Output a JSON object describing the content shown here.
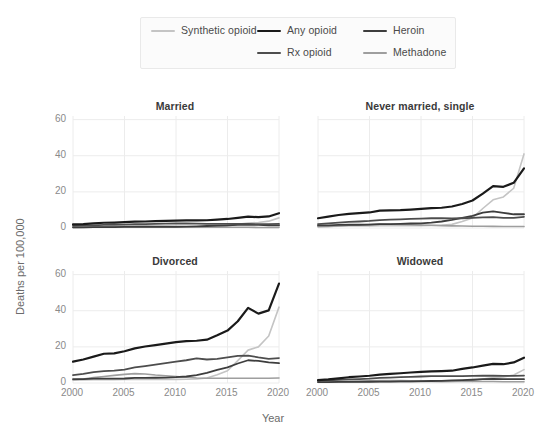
{
  "legend": {
    "items": [
      {
        "label": "Any opioid",
        "color": "#1a1a1a",
        "width": 2.2
      },
      {
        "label": "Rx opioid",
        "color": "#4d4d4d",
        "width": 1.8
      },
      {
        "label": "Heroin",
        "color": "#3d3d3d",
        "width": 1.8
      },
      {
        "label": "Methadone",
        "color": "#9e9e9e",
        "width": 1.6
      },
      {
        "label": "Synthetic opioid",
        "color": "#c4c4c4",
        "width": 1.6
      }
    ]
  },
  "axes": {
    "xlabel": "Year",
    "ylabel": "Deaths per 100,000",
    "yticks": [
      0,
      20,
      40,
      60
    ],
    "xticks": [
      2000,
      2005,
      2010,
      2015,
      2020
    ],
    "ylim": [
      0,
      62
    ],
    "xlim": [
      2000,
      2020
    ],
    "grid": true,
    "grid_color": "#ececec"
  },
  "chart_data": {
    "type": "line",
    "title": "",
    "xlabel": "Year",
    "ylabel": "Deaths per 100,000",
    "ylim": [
      0,
      62
    ],
    "xlim": [
      2000,
      2020
    ],
    "grid": true,
    "legend_position": "top-center",
    "x": [
      2000,
      2001,
      2002,
      2003,
      2004,
      2005,
      2006,
      2007,
      2008,
      2009,
      2010,
      2011,
      2012,
      2013,
      2014,
      2015,
      2016,
      2017,
      2018,
      2019,
      2020
    ],
    "panels": [
      {
        "title": "Married",
        "series": [
          {
            "name": "Any opioid",
            "color": "#1a1a1a",
            "values": [
              2.0,
              2.2,
              2.6,
              2.9,
              3.0,
              3.2,
              3.5,
              3.6,
              3.8,
              3.9,
              4.1,
              4.2,
              4.2,
              4.3,
              4.6,
              5.0,
              5.6,
              6.3,
              6.0,
              6.4,
              8.2
            ]
          },
          {
            "name": "Rx opioid",
            "color": "#4d4d4d",
            "values": [
              1.2,
              1.3,
              1.5,
              1.7,
              1.8,
              1.9,
              2.1,
              2.2,
              2.3,
              2.4,
              2.5,
              2.5,
              2.4,
              2.3,
              2.3,
              2.3,
              2.3,
              2.3,
              2.1,
              2.1,
              2.3
            ]
          },
          {
            "name": "Heroin",
            "color": "#3d3d3d",
            "values": [
              0.4,
              0.4,
              0.5,
              0.5,
              0.5,
              0.6,
              0.7,
              0.7,
              0.7,
              0.7,
              0.7,
              0.8,
              0.9,
              1.1,
              1.3,
              1.5,
              1.8,
              1.9,
              1.7,
              1.5,
              1.4
            ]
          },
          {
            "name": "Methadone",
            "color": "#9e9e9e",
            "values": [
              0.3,
              0.4,
              0.5,
              0.6,
              0.7,
              0.8,
              0.9,
              0.9,
              0.8,
              0.8,
              0.7,
              0.7,
              0.6,
              0.5,
              0.5,
              0.4,
              0.4,
              0.4,
              0.3,
              0.3,
              0.3
            ]
          },
          {
            "name": "Synthetic opioid",
            "color": "#c4c4c4",
            "values": [
              0.3,
              0.3,
              0.4,
              0.4,
              0.4,
              0.5,
              0.5,
              0.5,
              0.5,
              0.5,
              0.5,
              0.5,
              0.5,
              0.6,
              0.9,
              1.2,
              2.0,
              2.8,
              3.0,
              3.8,
              5.6
            ]
          }
        ]
      },
      {
        "title": "Never married, single",
        "series": [
          {
            "name": "Any opioid",
            "color": "#1a1a1a",
            "values": [
              5.4,
              6.3,
              7.2,
              7.8,
              8.2,
              8.6,
              9.6,
              9.8,
              9.9,
              10.2,
              10.6,
              11.0,
              11.2,
              11.9,
              13.3,
              15.2,
              19.0,
              23.2,
              22.8,
              25.0,
              33.0
            ]
          },
          {
            "name": "Rx opioid",
            "color": "#4d4d4d",
            "values": [
              2.2,
              2.6,
              3.0,
              3.4,
              3.6,
              3.9,
              4.4,
              4.6,
              4.8,
              5.0,
              5.2,
              5.4,
              5.4,
              5.3,
              5.4,
              5.6,
              5.9,
              6.0,
              5.6,
              5.6,
              6.2
            ]
          },
          {
            "name": "Heroin",
            "color": "#3d3d3d",
            "values": [
              1.4,
              1.5,
              1.7,
              1.8,
              1.8,
              1.9,
              2.2,
              2.2,
              2.3,
              2.5,
              2.6,
              3.0,
              3.6,
              4.5,
              5.6,
              6.7,
              8.5,
              9.2,
              8.4,
              7.6,
              7.6
            ]
          },
          {
            "name": "Methadone",
            "color": "#9e9e9e",
            "values": [
              0.7,
              0.9,
              1.2,
              1.5,
              1.7,
              1.9,
              2.2,
              2.1,
              1.9,
              1.8,
              1.6,
              1.5,
              1.3,
              1.2,
              1.1,
              1.0,
              1.0,
              0.9,
              0.8,
              0.8,
              0.8
            ]
          },
          {
            "name": "Synthetic opioid",
            "color": "#c4c4c4",
            "values": [
              0.8,
              0.9,
              1.0,
              1.1,
              1.1,
              1.2,
              1.3,
              1.3,
              1.3,
              1.3,
              1.3,
              1.4,
              1.5,
              2.0,
              3.6,
              5.6,
              10.8,
              15.6,
              17.2,
              22.0,
              41.0
            ]
          }
        ]
      },
      {
        "title": "Divorced",
        "series": [
          {
            "name": "Any opioid",
            "color": "#1a1a1a",
            "values": [
              11.8,
              13.0,
              14.6,
              16.2,
              16.4,
              17.6,
              19.2,
              20.2,
              21.0,
              21.8,
              22.6,
              23.2,
              23.4,
              24.0,
              26.4,
              29.0,
              34.2,
              41.6,
              38.4,
              40.2,
              55.0
            ]
          },
          {
            "name": "Rx opioid",
            "color": "#4d4d4d",
            "values": [
              4.4,
              5.0,
              6.0,
              6.6,
              6.8,
              7.4,
              8.6,
              9.4,
              10.2,
              11.0,
              11.8,
              12.6,
              13.6,
              13.0,
              13.4,
              14.2,
              15.0,
              15.2,
              14.2,
              13.4,
              13.8
            ]
          },
          {
            "name": "Heroin",
            "color": "#3d3d3d",
            "values": [
              2.2,
              2.2,
              2.4,
              2.4,
              2.4,
              2.5,
              2.8,
              2.8,
              2.9,
              3.0,
              3.2,
              3.6,
              4.4,
              5.6,
              7.2,
              8.6,
              10.8,
              12.6,
              12.2,
              11.4,
              11.0
            ]
          },
          {
            "name": "Methadone",
            "color": "#9e9e9e",
            "values": [
              1.8,
              2.2,
              3.0,
              3.6,
              4.2,
              4.8,
              5.2,
              5.0,
              4.4,
              4.0,
              3.6,
              3.2,
              2.8,
              2.6,
              2.6,
              2.6,
              2.6,
              2.6,
              2.6,
              2.6,
              2.8
            ]
          },
          {
            "name": "Synthetic opioid",
            "color": "#c4c4c4",
            "values": [
              1.6,
              1.7,
              1.8,
              1.8,
              1.8,
              1.9,
              2.0,
              2.0,
              2.0,
              2.0,
              2.0,
              2.1,
              2.2,
              2.8,
              4.6,
              6.8,
              12.4,
              18.2,
              20.0,
              26.0,
              42.0
            ]
          }
        ]
      },
      {
        "title": "Widowed",
        "series": [
          {
            "name": "Any opioid",
            "color": "#1a1a1a",
            "values": [
              1.6,
              2.0,
              2.6,
              3.2,
              3.6,
              4.0,
              4.6,
              5.0,
              5.4,
              5.8,
              6.2,
              6.4,
              6.6,
              6.8,
              7.8,
              8.6,
              9.6,
              10.6,
              10.4,
              11.4,
              14.0
            ]
          },
          {
            "name": "Rx opioid",
            "color": "#4d4d4d",
            "values": [
              1.2,
              1.4,
              1.7,
              2.0,
              2.2,
              2.4,
              2.8,
              3.0,
              3.2,
              3.4,
              3.6,
              3.8,
              3.8,
              3.8,
              3.8,
              3.9,
              4.0,
              4.1,
              3.9,
              3.9,
              4.1
            ]
          },
          {
            "name": "Heroin",
            "color": "#3d3d3d",
            "values": [
              0.5,
              0.5,
              0.6,
              0.6,
              0.7,
              0.7,
              0.8,
              0.8,
              0.9,
              0.9,
              1.0,
              1.1,
              1.2,
              1.4,
              1.6,
              1.8,
              2.1,
              2.3,
              2.2,
              2.1,
              2.1
            ]
          },
          {
            "name": "Methadone",
            "color": "#9e9e9e",
            "values": [
              0.4,
              0.5,
              0.7,
              0.9,
              1.0,
              1.2,
              1.4,
              1.4,
              1.3,
              1.2,
              1.1,
              1.0,
              0.9,
              0.8,
              0.8,
              0.8,
              0.8,
              0.8,
              0.7,
              0.7,
              0.7
            ]
          },
          {
            "name": "Synthetic opioid",
            "color": "#c4c4c4",
            "values": [
              0.4,
              0.4,
              0.5,
              0.5,
              0.5,
              0.6,
              0.6,
              0.6,
              0.6,
              0.6,
              0.6,
              0.7,
              0.7,
              0.8,
              1.1,
              1.4,
              2.2,
              3.0,
              3.4,
              4.4,
              7.4
            ]
          }
        ]
      }
    ]
  }
}
